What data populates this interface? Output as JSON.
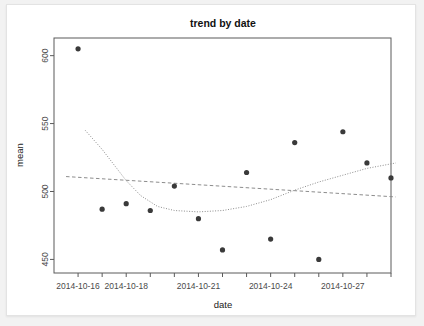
{
  "chart_data": {
    "type": "scatter",
    "title": "trend by date",
    "xlabel": "date",
    "ylabel": "mean",
    "grid": false,
    "legend": null,
    "x_tick_labels": [
      "2014-10-16",
      "2014-10-18",
      "2014-10-21",
      "2014-10-24",
      "2014-10-27"
    ],
    "x_tick_values": [
      "2014-10-16",
      "2014-10-18",
      "2014-10-21",
      "2014-10-24",
      "2014-10-27"
    ],
    "y_tick_labels": [
      "450",
      "500",
      "550",
      "600"
    ],
    "y_tick_values": [
      450,
      500,
      550,
      600
    ],
    "ylim": [
      440,
      613
    ],
    "xlim": [
      "2014-10-15",
      "2014-10-29"
    ],
    "x": [
      "2014-10-16",
      "2014-10-17",
      "2014-10-18",
      "2014-10-19",
      "2014-10-20",
      "2014-10-21",
      "2014-10-22",
      "2014-10-23",
      "2014-10-24",
      "2014-10-25",
      "2014-10-26",
      "2014-10-27",
      "2014-10-28",
      "2014-10-29"
    ],
    "values": [
      605,
      487,
      491,
      486,
      504,
      480,
      457,
      514,
      465,
      536,
      450,
      544,
      521,
      510
    ],
    "points": [
      {
        "x": "2014-10-16",
        "y": 605
      },
      {
        "x": "2014-10-17",
        "y": 487
      },
      {
        "x": "2014-10-18",
        "y": 491
      },
      {
        "x": "2014-10-19",
        "y": 486
      },
      {
        "x": "2014-10-20",
        "y": 504
      },
      {
        "x": "2014-10-21",
        "y": 480
      },
      {
        "x": "2014-10-22",
        "y": 457
      },
      {
        "x": "2014-10-23",
        "y": 514
      },
      {
        "x": "2014-10-24",
        "y": 465
      },
      {
        "x": "2014-10-25",
        "y": 536
      },
      {
        "x": "2014-10-26",
        "y": 450
      },
      {
        "x": "2014-10-27",
        "y": 544
      },
      {
        "x": "2014-10-28",
        "y": 521
      },
      {
        "x": "2014-10-29",
        "y": 510
      }
    ],
    "series": [
      {
        "name": "linear-fit",
        "style": "dashed",
        "x": [
          "2014-10-15.5",
          "2014-10-29.2"
        ],
        "values": [
          511,
          496
        ]
      },
      {
        "name": "loess-fit",
        "style": "dotted",
        "x": [
          "2014-10-16.3",
          "2014-10-17",
          "2014-10-18",
          "2014-10-18.6",
          "2014-10-19.3",
          "2014-10-20",
          "2014-10-21",
          "2014-10-22",
          "2014-10-23",
          "2014-10-24",
          "2014-10-25",
          "2014-10-26",
          "2014-10-27",
          "2014-10-28",
          "2014-10-29.2"
        ],
        "values": [
          545,
          531,
          508,
          497,
          489,
          486,
          485,
          486,
          489,
          494,
          501,
          507,
          512,
          517,
          521
        ]
      }
    ]
  },
  "plot": {
    "geometry": {
      "frame_left": 47,
      "frame_right": 384,
      "frame_top": 33,
      "frame_bottom": 268
    }
  }
}
